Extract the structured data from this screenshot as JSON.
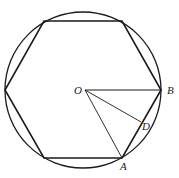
{
  "diagram": {
    "type": "geometry",
    "labels": {
      "center": "O",
      "vertex_b": "B",
      "vertex_a": "A",
      "point_d": "D"
    },
    "colors": {
      "stroke": "#1a1a1a",
      "background": "#ffffff"
    }
  }
}
